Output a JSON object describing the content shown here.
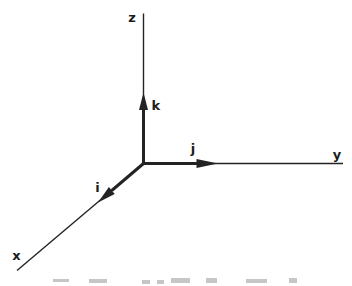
{
  "figure": {
    "background_color": "#ffffff",
    "line_color": "#232323",
    "axis_labels": {
      "x": "x",
      "y": "y",
      "z": "z"
    },
    "unit_vector_labels": {
      "i": "i",
      "j": "j",
      "k": "k"
    }
  }
}
